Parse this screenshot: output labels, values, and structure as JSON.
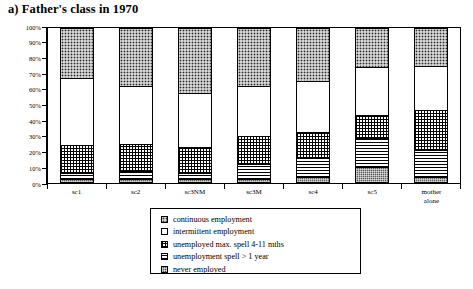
{
  "title": "a)  Father's  class in 1970",
  "axis": {
    "y_ticks": [
      "100%",
      "90%",
      "80%",
      "70%",
      "60%",
      "50%",
      "40%",
      "30%",
      "20%",
      "10%",
      "0%"
    ]
  },
  "legend": {
    "items": [
      {
        "label": "continuous employment",
        "pattern": "p-continuous",
        "swatch": "dark-stipple-swatch"
      },
      {
        "label": "intermittent employment",
        "pattern": "p-intermittent",
        "swatch": "white-swatch"
      },
      {
        "label": "unemployed max. spell 4-11 mths",
        "pattern": "p-maxspell",
        "swatch": "grid-swatch"
      },
      {
        "label": "unemployment spell   > 1 year",
        "pattern": "p-year",
        "swatch": "horizontal-lines-swatch"
      },
      {
        "label": "never employed",
        "pattern": "p-never",
        "swatch": "light-stipple-swatch"
      }
    ]
  },
  "chart_data": {
    "type": "bar",
    "title": "a)  Father's  class in 1970",
    "xlabel": "",
    "ylabel": "",
    "ylim": [
      0,
      100
    ],
    "stacked": true,
    "grid": false,
    "legend_position": "bottom-center",
    "categories": [
      "sc1",
      "sc2",
      "sc3NM",
      "sc3M",
      "sc4",
      "sc5",
      "mother alone"
    ],
    "category_lines": [
      [
        "sc1"
      ],
      [
        "sc2"
      ],
      [
        "sc3NM"
      ],
      [
        "sc3M"
      ],
      [
        "sc4"
      ],
      [
        "sc5"
      ],
      [
        "mother",
        "alone"
      ]
    ],
    "series": [
      {
        "name": "continuous employment",
        "values": [
          32,
          37,
          42,
          37,
          34,
          25,
          24
        ]
      },
      {
        "name": "intermittent employment",
        "values": [
          44,
          38,
          35,
          33,
          33,
          31,
          29
        ]
      },
      {
        "name": "unemployed max. spell 4-11 mths",
        "values": [
          18,
          18,
          17,
          18,
          17,
          15,
          26
        ]
      },
      {
        "name": "unemployment spell   > 1 year",
        "values": [
          4,
          5,
          4,
          10,
          13,
          19,
          18
        ]
      },
      {
        "name": "never employed",
        "values": [
          2,
          2,
          2,
          2,
          3,
          10,
          3
        ]
      }
    ],
    "stack_order_bottom_to_top": [
      "never employed",
      "unemployment spell   > 1 year",
      "unemployed max. spell 4-11 mths",
      "intermittent employment",
      "continuous employment"
    ],
    "cumulative_tops": {
      "sc1": {
        "never": 2,
        "year": 6,
        "maxspell": 24,
        "intermittent": 68,
        "continuous": 100
      },
      "sc2": {
        "never": 2,
        "year": 7,
        "maxspell": 25,
        "intermittent": 63,
        "continuous": 100
      },
      "sc3NM": {
        "never": 2,
        "year": 6,
        "maxspell": 23,
        "intermittent": 58,
        "continuous": 100
      },
      "sc3M": {
        "never": 2,
        "year": 12,
        "maxspell": 30,
        "intermittent": 63,
        "continuous": 100
      },
      "sc4": {
        "never": 3,
        "year": 16,
        "maxspell": 33,
        "intermittent": 66,
        "continuous": 100
      },
      "sc5": {
        "never": 10,
        "year": 29,
        "maxspell": 44,
        "intermittent": 75,
        "continuous": 100
      },
      "mother alone": {
        "never": 3,
        "year": 21,
        "maxspell": 47,
        "intermittent": 76,
        "continuous": 100
      }
    }
  }
}
